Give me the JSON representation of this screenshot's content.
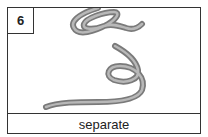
{
  "card": {
    "number": "6",
    "caption": "separate",
    "illustration": "coiled-tube-icon"
  },
  "colors": {
    "border": "#333333",
    "tube": "#8c8c8c",
    "tube_highlight": "#bdbdbd",
    "text": "#222222"
  }
}
